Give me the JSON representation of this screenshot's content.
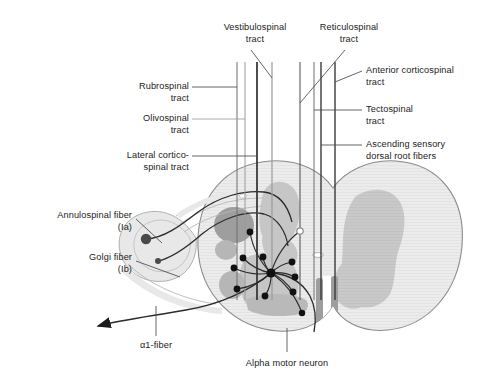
{
  "figure": {
    "width": 481,
    "height": 384,
    "background": "#ffffff"
  },
  "colors": {
    "background": "#ffffff",
    "text": "#1c1c1c",
    "leader_line": "#4a4a4a",
    "tract_line_dark": "#3a3a3a",
    "tract_line_mid": "#6e6e6e",
    "tract_line_light": "#9a9a9a",
    "cord_outline": "#8c8c8c",
    "white_matter": "#ececed",
    "gray_matter": "#c9c9c9",
    "gray_matter_dark": "#b4b4b4",
    "tract_patch_dark": "#999999",
    "fiber_dark": "#2b2b2b",
    "fiber_sheath": "#e4e4e4",
    "synapse_dot": "#111111",
    "synapse_dot_open": "#8a8a8a",
    "central_canal": "#ffffff"
  },
  "labels": {
    "top": [
      {
        "id": "vestibulospinal",
        "name": "label-vestibulospinal-tract",
        "lines": [
          "Vestibulospinal",
          "tract"
        ],
        "x": 203,
        "y": 22,
        "width": 104,
        "align": "center"
      },
      {
        "id": "reticulospinal",
        "name": "label-reticulospinal-tract",
        "lines": [
          "Reticulospinal",
          "tract"
        ],
        "x": 300,
        "y": 22,
        "width": 98,
        "align": "center"
      }
    ],
    "left": [
      {
        "id": "rubrospinal",
        "name": "label-rubrospinal-tract",
        "lines": [
          "Rubrospinal",
          "tract"
        ],
        "x": 60,
        "y": 81,
        "width": 129,
        "align": "right"
      },
      {
        "id": "olivospinal",
        "name": "label-olivospinal-tract",
        "lines": [
          "Olivospinal",
          "tract"
        ],
        "x": 60,
        "y": 113,
        "width": 129,
        "align": "right"
      },
      {
        "id": "lateral-corticospinal",
        "name": "label-lateral-corticospinal-tract",
        "lines": [
          "Lateral cortico-",
          "spinal tract"
        ],
        "x": 60,
        "y": 150,
        "width": 129,
        "align": "right"
      },
      {
        "id": "annulospinal",
        "name": "label-annulospinal-fiber",
        "lines": [
          "Annulospinal fiber",
          "(Ia)"
        ],
        "x": 10,
        "y": 210,
        "width": 122,
        "align": "right"
      },
      {
        "id": "golgi",
        "name": "label-golgi-fiber",
        "lines": [
          "Golgi fiber",
          "(Ib)"
        ],
        "x": 10,
        "y": 252,
        "width": 122,
        "align": "right"
      }
    ],
    "right": [
      {
        "id": "anterior-corticospinal",
        "name": "label-anterior-corticospinal-tract",
        "lines": [
          "Anterior corticospinal",
          "tract"
        ],
        "x": 366,
        "y": 65,
        "width": 115,
        "align": "left"
      },
      {
        "id": "tectospinal",
        "name": "label-tectospinal-tract",
        "lines": [
          "Tectospinal",
          "tract"
        ],
        "x": 366,
        "y": 104,
        "width": 115,
        "align": "left"
      },
      {
        "id": "ascending-sensory",
        "name": "label-ascending-sensory-dorsal-root-fibers",
        "lines": [
          "Ascending sensory",
          "dorsal root fibers"
        ],
        "x": 366,
        "y": 139,
        "width": 115,
        "align": "left"
      }
    ],
    "bottom": [
      {
        "id": "alpha1-fiber",
        "name": "label-alpha1-fiber",
        "lines": [
          "α1-fiber"
        ],
        "x": 112,
        "y": 340,
        "width": 88,
        "align": "center"
      },
      {
        "id": "alpha-motor-neuron",
        "name": "label-alpha-motor-neuron",
        "lines": [
          "Alpha motor neuron"
        ],
        "x": 222,
        "y": 358,
        "width": 130,
        "align": "center"
      }
    ]
  },
  "anatomy": {
    "cord_outline_name": "spinal-cord-outline",
    "white_matter_name": "white-matter",
    "gray_matter_left_name": "gray-matter-left-horn",
    "gray_matter_right_name": "gray-matter-right-horn",
    "central_canal_name": "central-canal",
    "ventral_fissure_name": "ventral-median-fissure",
    "spindle_name": "muscle-spindle-organ",
    "motor_neuron_soma_name": "alpha-motor-neuron-soma",
    "dorsal_root_name": "dorsal-root-fibers",
    "ventral_root_name": "ventral-root-fiber",
    "axon_arrow_name": "alpha1-fiber-arrowhead"
  },
  "tracts": {
    "vertical_lines": [
      {
        "id": "t1",
        "name": "tract-line-rubrospinal",
        "x": 237,
        "color": "#6e6e6e",
        "width": 1.0
      },
      {
        "id": "t2",
        "name": "tract-line-olivospinal",
        "x": 245,
        "color": "#9a9a9a",
        "width": 1.0
      },
      {
        "id": "t3",
        "name": "tract-line-lateral-corticospinal",
        "x": 257,
        "color": "#3a3a3a",
        "width": 1.8
      },
      {
        "id": "t4",
        "name": "tract-line-vestibulospinal",
        "x": 272,
        "color": "#9a9a9a",
        "width": 1.2
      },
      {
        "id": "t5",
        "name": "tract-line-reticulospinal",
        "x": 300,
        "color": "#4a4a4a",
        "width": 1.0
      },
      {
        "id": "t6",
        "name": "tract-line-tectospinal",
        "x": 314,
        "color": "#6e6e6e",
        "width": 1.0
      },
      {
        "id": "t7",
        "name": "tract-line-ascending-sensory",
        "x": 321,
        "color": "#3a3a3a",
        "width": 1.4
      },
      {
        "id": "t8",
        "name": "tract-line-anterior-corticospinal",
        "x": 335,
        "color": "#3a3a3a",
        "width": 1.4
      }
    ]
  },
  "synapses": {
    "count": 11,
    "hub": {
      "x": 271,
      "y": 273,
      "name": "alpha-motor-neuron-soma"
    },
    "terminals": [
      {
        "name": "synapse-terminal-1",
        "x": 250,
        "y": 232,
        "r": 3.4,
        "filled": true
      },
      {
        "name": "synapse-terminal-2",
        "x": 300,
        "y": 231,
        "r": 3.2,
        "filled": false
      },
      {
        "name": "synapse-terminal-3",
        "x": 243,
        "y": 258,
        "r": 3.4,
        "filled": true
      },
      {
        "name": "synapse-terminal-4",
        "x": 263,
        "y": 257,
        "r": 3.4,
        "filled": true
      },
      {
        "name": "synapse-terminal-5",
        "x": 292,
        "y": 262,
        "r": 3.4,
        "filled": true
      },
      {
        "name": "synapse-terminal-6",
        "x": 234,
        "y": 268,
        "r": 3.4,
        "filled": true
      },
      {
        "name": "synapse-terminal-7",
        "x": 295,
        "y": 277,
        "r": 3.4,
        "filled": true
      },
      {
        "name": "synapse-terminal-8",
        "x": 237,
        "y": 289,
        "r": 3.4,
        "filled": true
      },
      {
        "name": "synapse-terminal-9",
        "x": 293,
        "y": 292,
        "r": 3.4,
        "filled": true
      },
      {
        "name": "synapse-terminal-10",
        "x": 265,
        "y": 296,
        "r": 3.4,
        "filled": true
      },
      {
        "name": "synapse-terminal-11",
        "x": 302,
        "y": 313,
        "r": 3.2,
        "filled": true
      }
    ]
  },
  "receptors": {
    "annulospinal_dot": {
      "name": "annulospinal-receptor-dot",
      "x": 146,
      "y": 239,
      "r": 5.2
    },
    "golgi_dot": {
      "name": "golgi-receptor-dot",
      "x": 158,
      "y": 261,
      "r": 3.0
    }
  }
}
